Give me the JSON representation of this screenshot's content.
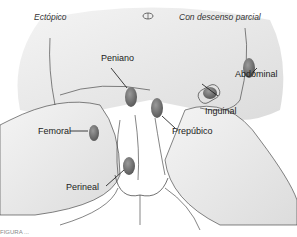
{
  "diagram": {
    "headers": {
      "left": "Ectópico",
      "right": "Con descenso parcial"
    },
    "labels": [
      {
        "id": "peniano",
        "text": "Peniano"
      },
      {
        "id": "abdominal",
        "text": "Abdominal"
      },
      {
        "id": "inguinal",
        "text": "Inguinal"
      },
      {
        "id": "femoral",
        "text": "Femoral"
      },
      {
        "id": "prepubico",
        "text": "Prepúbico"
      },
      {
        "id": "perineal",
        "text": "Perineal"
      }
    ],
    "caption": "FIGURA ..."
  }
}
